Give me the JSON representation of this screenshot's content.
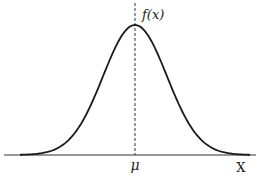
{
  "chart_data": {
    "type": "line",
    "title": "",
    "series": [
      {
        "name": "f(x)",
        "function": "normal_pdf",
        "mean": 0,
        "std": 1
      }
    ],
    "x_range": [
      -3.6,
      3.6
    ],
    "xlabel": "X",
    "curve_label": "f(x)",
    "mean_marker": {
      "label": "μ",
      "x": 0,
      "style": "dashed"
    },
    "ylabel": "",
    "grid": false,
    "legend": "none",
    "colors": {
      "curve": "#1a1a1a",
      "axis": "#333333",
      "mean_line": "#333333"
    }
  }
}
